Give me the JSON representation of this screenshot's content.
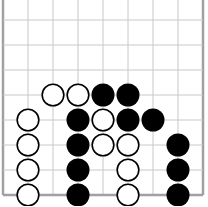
{
  "board": {
    "description": "Go board fragment (bottom edge, left and right edges visible)",
    "grid": {
      "x_lines": [
        3,
        28,
        53,
        78,
        103,
        128,
        153,
        178,
        203
      ],
      "y_lines": [
        -5,
        20,
        45,
        70,
        95,
        120,
        145,
        170,
        195
      ],
      "line_color": "#c8c8c8",
      "edge_color": "#a0a0a0"
    },
    "stones": [
      {
        "color": "white",
        "col": 2,
        "row": 4
      },
      {
        "color": "white",
        "col": 3,
        "row": 4
      },
      {
        "color": "black",
        "col": 4,
        "row": 4
      },
      {
        "color": "black",
        "col": 5,
        "row": 4
      },
      {
        "color": "white",
        "col": 1,
        "row": 5
      },
      {
        "color": "black",
        "col": 3,
        "row": 5
      },
      {
        "color": "white",
        "col": 4,
        "row": 5
      },
      {
        "color": "black",
        "col": 5,
        "row": 5
      },
      {
        "color": "black",
        "col": 6,
        "row": 5
      },
      {
        "color": "white",
        "col": 1,
        "row": 6
      },
      {
        "color": "black",
        "col": 3,
        "row": 6
      },
      {
        "color": "white",
        "col": 4,
        "row": 6
      },
      {
        "color": "white",
        "col": 5,
        "row": 6
      },
      {
        "color": "black",
        "col": 7,
        "row": 6
      },
      {
        "color": "white",
        "col": 1,
        "row": 7
      },
      {
        "color": "black",
        "col": 3,
        "row": 7
      },
      {
        "color": "white",
        "col": 5,
        "row": 7
      },
      {
        "color": "black",
        "col": 7,
        "row": 7
      },
      {
        "color": "white",
        "col": 1,
        "row": 8
      },
      {
        "color": "black",
        "col": 3,
        "row": 8
      },
      {
        "color": "white",
        "col": 5,
        "row": 8
      },
      {
        "color": "black",
        "col": 7,
        "row": 8
      }
    ],
    "colors": {
      "black_stone": "#000000",
      "white_stone_fill": "#ffffff",
      "white_stone_stroke": "#000000"
    }
  }
}
